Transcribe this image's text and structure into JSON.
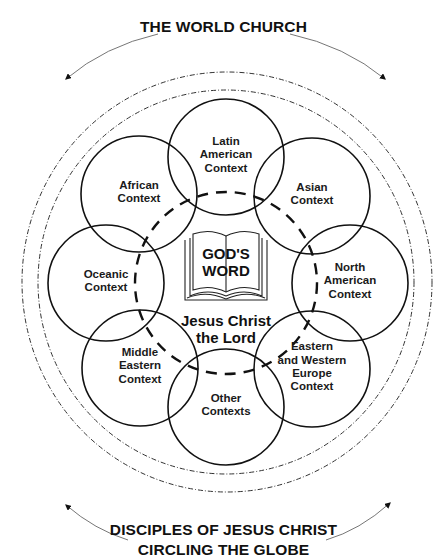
{
  "top_title": "THE WORLD CHURCH",
  "bottom_title": [
    "DISCIPLES OF JESUS CHRIST",
    "CIRCLING THE GLOBE"
  ],
  "center": {
    "book_icon": "open-bible-icon",
    "book_text": [
      "GOD'S",
      "WORD"
    ],
    "lord_text": [
      "Jesus Christ",
      "the Lord"
    ]
  },
  "contexts": [
    {
      "name": "latin-american",
      "lines": [
        "Latin",
        "American",
        "Context"
      ],
      "cx": 226,
      "cy": 157
    },
    {
      "name": "asian",
      "lines": [
        "Asian",
        "Context"
      ],
      "cx": 312,
      "cy": 196
    },
    {
      "name": "north-american",
      "lines": [
        "North",
        "American",
        "Context"
      ],
      "cx": 350,
      "cy": 283
    },
    {
      "name": "eastern-western-europe",
      "lines": [
        "Eastern",
        "and Western",
        "Europe",
        "Context"
      ],
      "cx": 312,
      "cy": 369
    },
    {
      "name": "other",
      "lines": [
        "Other",
        "Contexts"
      ],
      "cx": 226,
      "cy": 407
    },
    {
      "name": "middle-eastern",
      "lines": [
        "Middle",
        "Eastern",
        "Context"
      ],
      "cx": 140,
      "cy": 368
    },
    {
      "name": "oceanic",
      "lines": [
        "Oceanic",
        "Context"
      ],
      "cx": 106,
      "cy": 283
    },
    {
      "name": "african",
      "lines": [
        "African",
        "Context"
      ],
      "cx": 139,
      "cy": 194
    }
  ],
  "colors": {
    "stroke": "#111111",
    "background": "#ffffff",
    "arrow": "#555555"
  }
}
